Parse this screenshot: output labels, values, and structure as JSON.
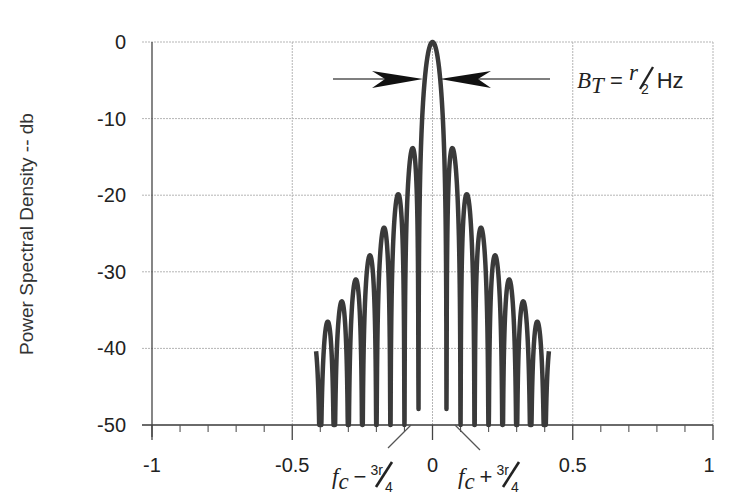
{
  "chart_data": {
    "type": "line",
    "title": "",
    "xlabel": "",
    "ylabel": "Power Spectral Density -- db",
    "xlim": [
      -1,
      1
    ],
    "ylim": [
      -50,
      0
    ],
    "x_ticks": [
      -1,
      -0.5,
      0,
      0.5,
      1
    ],
    "x_tick_labels": [
      "-1",
      "-0.5",
      "0",
      "0.5",
      "1"
    ],
    "x_minor_tick_step": 0.1,
    "y_ticks": [
      0,
      -10,
      -20,
      -30,
      -40,
      -50
    ],
    "y_tick_labels": [
      "0",
      "-10",
      "-20",
      "-30",
      "-40",
      "-50"
    ],
    "grid": true,
    "series": [
      {
        "name": "PSD (sinc^2 spectrum)",
        "color": "#3a3a3a",
        "description": "Main lobe centered at 0 with peak 0 dB; sidelobes decreasing symmetrically, truncated at about ±0.42",
        "main_lobe_peak": {
          "x": 0,
          "y": 0
        },
        "main_lobe_null_depth_db": -46,
        "sidelobe_peaks_right": [
          {
            "x": 0.035,
            "y": -22.5
          },
          {
            "x": 0.085,
            "y": -27
          },
          {
            "x": 0.135,
            "y": -33
          },
          {
            "x": 0.185,
            "y": -36.5
          },
          {
            "x": 0.235,
            "y": -40
          },
          {
            "x": 0.285,
            "y": -44
          },
          {
            "x": 0.33,
            "y": -46.5
          },
          {
            "x": 0.385,
            "y": -48
          }
        ],
        "sidelobe_peaks_left": [
          {
            "x": -0.035,
            "y": -22.5
          },
          {
            "x": -0.085,
            "y": -27
          },
          {
            "x": -0.135,
            "y": -33
          },
          {
            "x": -0.185,
            "y": -36.5
          },
          {
            "x": -0.235,
            "y": -40
          },
          {
            "x": -0.285,
            "y": -44
          },
          {
            "x": -0.33,
            "y": -46.5
          },
          {
            "x": -0.385,
            "y": -48
          }
        ]
      }
    ],
    "annotations": [
      {
        "text": "B_T = r/2 Hz",
        "type": "bandwidth-arrows",
        "y": -5
      },
      {
        "text": "f_c − 3r/4",
        "x": -0.1,
        "type": "leader-label"
      },
      {
        "text": "f_c + 3r/4",
        "x": 0.1,
        "type": "leader-label"
      }
    ]
  },
  "labels": {
    "ylabel": "Power Spectral Density -- db",
    "bandwidth_B": "B",
    "bandwidth_sub": "T",
    "bandwidth_eq": " = ",
    "bandwidth_num": "r",
    "bandwidth_den": "2",
    "bandwidth_unit": "Hz",
    "fc": "f",
    "fc_sub": "c",
    "minus": "−",
    "plus": "+",
    "frac_num": "3r",
    "frac_den": "4"
  }
}
